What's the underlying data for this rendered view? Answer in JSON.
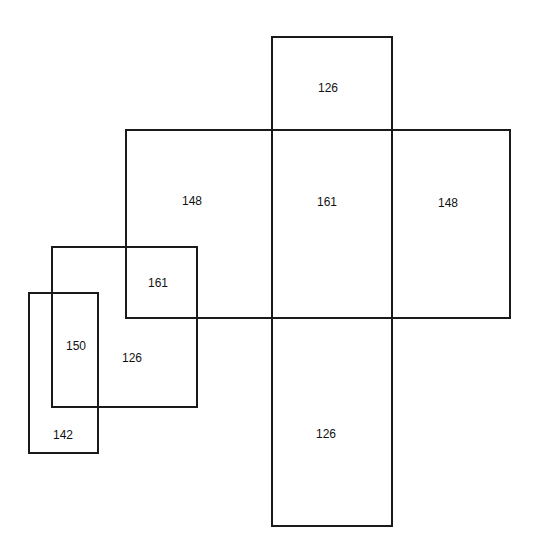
{
  "diagram": {
    "shapes": [
      {
        "id": "vertical-bar",
        "x": 271,
        "y": 36,
        "w": 122,
        "h": 491
      },
      {
        "id": "horizontal-bar",
        "x": 125,
        "y": 129,
        "w": 386,
        "h": 190
      },
      {
        "id": "square",
        "x": 51,
        "y": 246,
        "w": 147,
        "h": 162
      },
      {
        "id": "tall-rect",
        "x": 28,
        "y": 292,
        "w": 71,
        "h": 162
      }
    ],
    "labels": [
      {
        "text": "126",
        "x": 328,
        "y": 88
      },
      {
        "text": "148",
        "x": 192,
        "y": 201
      },
      {
        "text": "161",
        "x": 327,
        "y": 202
      },
      {
        "text": "148",
        "x": 448,
        "y": 203
      },
      {
        "text": "161",
        "x": 158,
        "y": 283
      },
      {
        "text": "150",
        "x": 76,
        "y": 346
      },
      {
        "text": "126",
        "x": 132,
        "y": 358
      },
      {
        "text": "142",
        "x": 63,
        "y": 435
      },
      {
        "text": "126",
        "x": 326,
        "y": 434
      }
    ]
  }
}
